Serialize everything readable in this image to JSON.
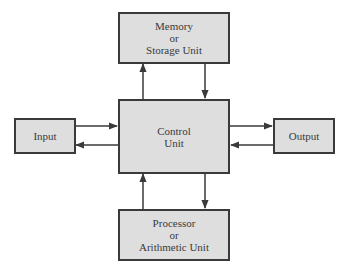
{
  "diagram": {
    "nodes": {
      "memory": {
        "lines": [
          "Memory",
          "or",
          "Storage Unit"
        ]
      },
      "control": {
        "lines": [
          "Control",
          "Unit"
        ]
      },
      "input": {
        "lines": [
          "Input"
        ]
      },
      "output": {
        "lines": [
          "Output"
        ]
      },
      "processor": {
        "lines": [
          "Processor",
          "or",
          "Arithmetic Unit"
        ]
      }
    },
    "edges": [
      {
        "from": "control",
        "to": "memory"
      },
      {
        "from": "memory",
        "to": "control"
      },
      {
        "from": "input",
        "to": "control"
      },
      {
        "from": "control",
        "to": "input"
      },
      {
        "from": "control",
        "to": "output"
      },
      {
        "from": "output",
        "to": "control"
      },
      {
        "from": "processor",
        "to": "control"
      },
      {
        "from": "control",
        "to": "processor"
      }
    ],
    "colors": {
      "box_fill": "#dedede",
      "stroke": "#3a3a3a"
    }
  }
}
